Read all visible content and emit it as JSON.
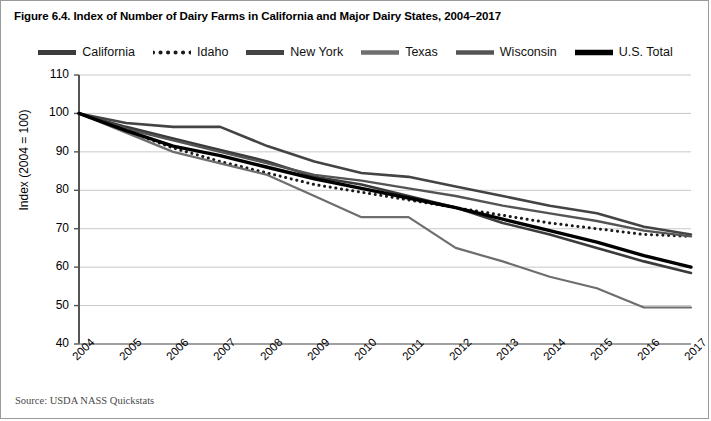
{
  "figure": {
    "title": "Figure 6.4. Index of Number of Dairy Farms in California and Major Dairy States, 2004–2017",
    "source": "Source: USDA NASS Quickstats"
  },
  "legend": {
    "position": "top-center",
    "items": [
      {
        "label": "California",
        "color": "#3b3b3b",
        "style": "solid",
        "width": 2.6
      },
      {
        "label": "Idaho",
        "color": "#1a1a1a",
        "style": "dotted",
        "width": 3.0
      },
      {
        "label": "New York",
        "color": "#444444",
        "style": "solid",
        "width": 2.6
      },
      {
        "label": "Texas",
        "color": "#6e6e6e",
        "style": "solid",
        "width": 2.2
      },
      {
        "label": "Wisconsin",
        "color": "#545454",
        "style": "solid",
        "width": 2.4
      },
      {
        "label": "U.S. Total",
        "color": "#000000",
        "style": "solid",
        "width": 3.4
      }
    ]
  },
  "axes": {
    "ylabel": "Index (2004 = 100)",
    "yticks": [
      110,
      100,
      90,
      80,
      70,
      60,
      50,
      40
    ],
    "ylim": [
      40,
      110
    ],
    "xlabel": "",
    "xticks": [
      "2004",
      "2005",
      "2006",
      "2007",
      "2008",
      "2009",
      "2010",
      "2011",
      "2012",
      "2013",
      "2014",
      "2015",
      "2016",
      "2017"
    ],
    "grid": "horizontal",
    "grid_color": "#c9c9c9",
    "axis_color": "#808080"
  },
  "chart_data": {
    "type": "line",
    "title": "Figure 6.4. Index of Number of Dairy Farms in California and Major Dairy States, 2004–2017",
    "xlabel": "",
    "ylabel": "Index (2004 = 100)",
    "ylim": [
      40,
      110
    ],
    "grid": true,
    "legend_position": "top-center",
    "x": [
      "2004",
      "2005",
      "2006",
      "2007",
      "2008",
      "2009",
      "2010",
      "2011",
      "2012",
      "2013",
      "2014",
      "2015",
      "2016",
      "2017"
    ],
    "series": [
      {
        "name": "California",
        "color": "#3b3b3b",
        "style": "solid",
        "values": [
          100,
          96.5,
          93.5,
          90.5,
          87.5,
          83.5,
          81.5,
          78.5,
          75.5,
          71.5,
          68.5,
          65.0,
          61.5,
          58.5
        ]
      },
      {
        "name": "Idaho",
        "color": "#1a1a1a",
        "style": "dotted",
        "values": [
          100,
          95.5,
          91.0,
          87.5,
          84.5,
          81.5,
          79.5,
          77.5,
          75.5,
          73.5,
          71.5,
          70.0,
          68.5,
          68.0
        ]
      },
      {
        "name": "New York",
        "color": "#444444",
        "style": "solid",
        "values": [
          100,
          97.5,
          96.5,
          96.5,
          91.5,
          87.5,
          84.5,
          83.5,
          81.0,
          78.5,
          76.0,
          74.0,
          70.5,
          68.5
        ]
      },
      {
        "name": "Texas",
        "color": "#6e6e6e",
        "style": "solid",
        "values": [
          100,
          95.0,
          90.0,
          87.0,
          84.0,
          78.5,
          73.0,
          73.0,
          65.0,
          61.5,
          57.5,
          54.5,
          49.5,
          49.5
        ]
      },
      {
        "name": "Wisconsin",
        "color": "#545454",
        "style": "solid",
        "values": [
          100,
          96.0,
          93.0,
          90.0,
          87.0,
          84.0,
          82.5,
          80.5,
          78.5,
          76.0,
          74.0,
          72.0,
          69.5,
          68.0
        ]
      },
      {
        "name": "U.S. Total",
        "color": "#000000",
        "style": "solid",
        "values": [
          100,
          95.5,
          91.5,
          89.0,
          86.0,
          83.0,
          80.5,
          78.0,
          75.5,
          72.5,
          69.5,
          66.5,
          63.0,
          60.0
        ]
      }
    ]
  }
}
